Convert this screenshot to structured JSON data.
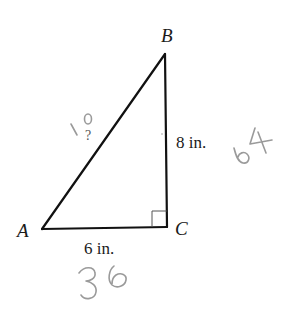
{
  "figure": {
    "type": "right-triangle",
    "right_angle_at": "C",
    "vertices": {
      "A": {
        "label": "A"
      },
      "B": {
        "label": "B"
      },
      "C": {
        "label": "C"
      }
    },
    "sides": {
      "BC": {
        "label": "8 in."
      },
      "AC": {
        "label": "6 in."
      },
      "AB": {
        "label": "?"
      }
    },
    "colors": {
      "lines": "#111111",
      "right_angle_marker": "#555555",
      "handwriting": "#9a9a9a"
    }
  },
  "handwritten_annotations": {
    "hypotenuse_answer": "10",
    "bc_squared": "64",
    "ac_squared": "36"
  }
}
